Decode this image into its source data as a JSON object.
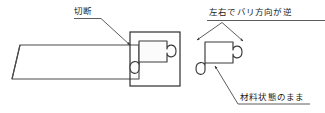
{
  "diagram": {
    "type": "technical-drawing",
    "colors": {
      "background": "#ffffff",
      "stroke": "#3a3a3a",
      "fill": "#ffffff",
      "text": "#1a1a1a"
    },
    "annotations": [
      {
        "id": "setsudan",
        "label": "切断",
        "leader": "down-right-arrow",
        "target": "cut-line"
      },
      {
        "id": "burr",
        "label": "左右でバリ方向が逆",
        "leader": "v-shaped-double-arrow",
        "target": "detached-piece-top-corners"
      },
      {
        "id": "material",
        "label": "材料状態のまま",
        "leader": "up-left-arrow",
        "target": "detached-piece-bottom-edge"
      }
    ],
    "shapes": [
      {
        "id": "strip",
        "name": "material-strip",
        "note": "long horizontal strip with chamfered left end"
      },
      {
        "id": "cut-frame",
        "name": "cut-region-frame",
        "note": "square outline enclosing the puzzle profile being cut"
      },
      {
        "id": "blank-in-strip",
        "name": "puzzle-blank-attached",
        "note": "puzzle-piece profile still joined to the strip"
      },
      {
        "id": "blank-detached",
        "name": "puzzle-blank-detached",
        "note": "separated puzzle piece shown at right"
      }
    ]
  }
}
